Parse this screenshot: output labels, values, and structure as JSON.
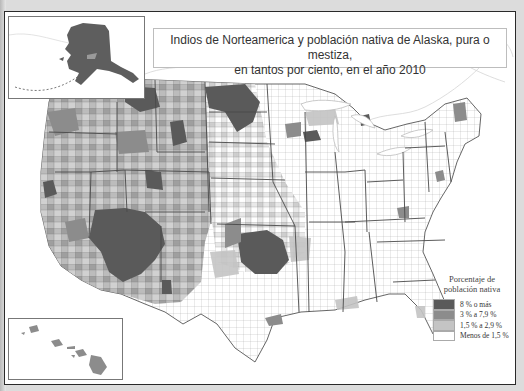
{
  "title": {
    "line1": "Indios de Norteamerica y población nativa de Alaska, pura o mestiza,",
    "line2": "en tantos por ciento, en el año 2010"
  },
  "legend": {
    "title_line1": "Porcentaje de",
    "title_line2": "población nativa",
    "items": [
      {
        "label": "8 % o más",
        "color": "#5a5a5a"
      },
      {
        "label": "3 % a 7,9 %",
        "color": "#8c8c8c"
      },
      {
        "label": "1,5 % a 2,9 %",
        "color": "#c4c4c4"
      },
      {
        "label": "Menos de 1,5 %",
        "color": "#ffffff"
      }
    ]
  },
  "insets": {
    "alaska": {
      "name": "Alaska",
      "fill": "#5e5e5e"
    },
    "hawaii": {
      "name": "Hawaii",
      "fill": "#8c8c8c"
    }
  },
  "colors": {
    "border": "#2a2a2a",
    "state_line": "#4a4a4a",
    "water_line": "#d0d0d0"
  }
}
